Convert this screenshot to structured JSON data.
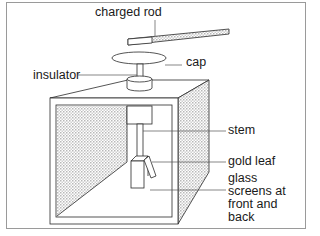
{
  "diagram": {
    "labels": {
      "charged_rod": "charged rod",
      "cap": "cap",
      "insulator": "insulator",
      "stem": "stem",
      "gold_leaf": "gold leaf",
      "glass_screens_line1": "glass",
      "glass_screens_line2": "screens at",
      "glass_screens_line3": "front and",
      "glass_screens_line4": "back"
    },
    "colors": {
      "stroke": "#2a2a2a",
      "hatch": "#c8c8c8",
      "leader": "#555555"
    }
  }
}
